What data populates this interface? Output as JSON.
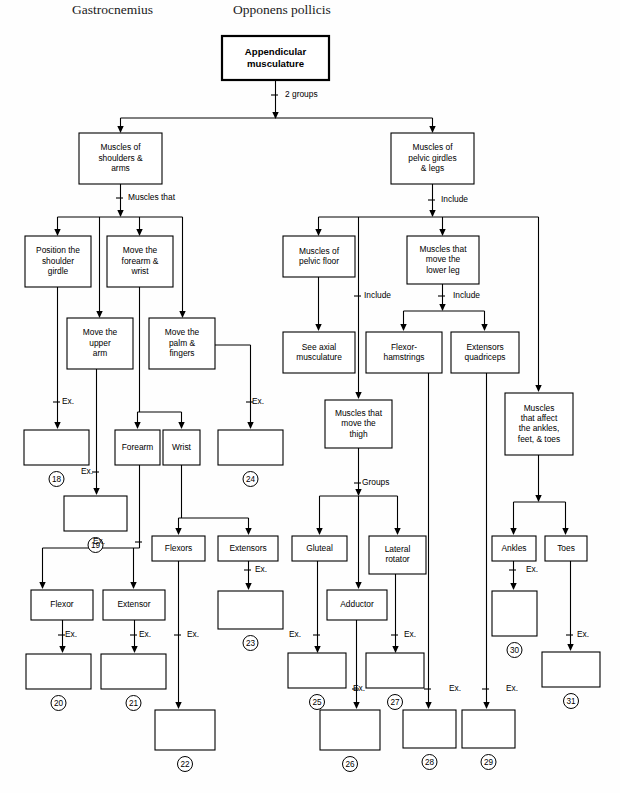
{
  "page": {
    "width": 620,
    "height": 793,
    "background": "#ffffff",
    "ink": "#000000"
  },
  "headers": [
    {
      "id": "h1",
      "text": "Gastrocnemius",
      "x": 72,
      "y": 10
    },
    {
      "id": "h2",
      "text": "Opponens pollicis",
      "x": 233,
      "y": 10
    }
  ],
  "chart_data": {
    "type": "diagram",
    "subtype": "hierarchical-flowchart",
    "root": "Appendicular musculature",
    "edge_labels": [
      "2 groups",
      "Muscles that",
      "Include",
      "Groups",
      "Ex."
    ],
    "answer_blanks": [
      18,
      19,
      20,
      21,
      22,
      23,
      24,
      25,
      26,
      27,
      28,
      29,
      30,
      31
    ]
  },
  "boxes": [
    {
      "id": "root",
      "label": "Appendicular\nmusculature",
      "x": 222,
      "y": 36,
      "w": 107,
      "h": 44,
      "bold": true
    },
    {
      "id": "shoulders",
      "label": "Muscles of\nshoulders &\narms",
      "x": 79,
      "y": 133,
      "w": 83,
      "h": 51
    },
    {
      "id": "pelvic",
      "label": "Muscles of\npelvic girdles\n& legs",
      "x": 391,
      "y": 133,
      "w": 83,
      "h": 51
    },
    {
      "id": "position",
      "label": "Position the\nshoulder\ngirdle",
      "x": 25,
      "y": 236,
      "w": 66,
      "h": 51
    },
    {
      "id": "forearmwrist",
      "label": "Move the\nforearm &\nwrist",
      "x": 107,
      "y": 236,
      "w": 66,
      "h": 51
    },
    {
      "id": "upperarm",
      "label": "Move the\nupper\narm",
      "x": 67,
      "y": 318,
      "w": 66,
      "h": 51
    },
    {
      "id": "palm",
      "label": "Move the\npalm &\nfingers",
      "x": 149,
      "y": 318,
      "w": 66,
      "h": 51
    },
    {
      "id": "pelvicfloor",
      "label": "Muscles of\npelvic floor",
      "x": 283,
      "y": 236,
      "w": 72,
      "h": 41
    },
    {
      "id": "lowerleg",
      "label": "Muscles that\nmove the\nlower leg",
      "x": 407,
      "y": 236,
      "w": 72,
      "h": 48
    },
    {
      "id": "seeaxial",
      "label": "See axial\nmusculature",
      "x": 283,
      "y": 332,
      "w": 72,
      "h": 41
    },
    {
      "id": "flexham",
      "label": "Flexor-\nhamstrings",
      "x": 366,
      "y": 332,
      "w": 76,
      "h": 41
    },
    {
      "id": "extquad",
      "label": "Extensors\nquadriceps",
      "x": 451,
      "y": 332,
      "w": 68,
      "h": 41
    },
    {
      "id": "anklesfeet",
      "label": "Muscles\nthat affect\nthe ankles,\nfeet, & toes",
      "x": 505,
      "y": 393,
      "w": 68,
      "h": 62
    },
    {
      "id": "thigh",
      "label": "Muscles that\nmove the\nthigh",
      "x": 325,
      "y": 400,
      "w": 67,
      "h": 48
    },
    {
      "id": "b18",
      "label": "",
      "x": 24,
      "y": 430,
      "w": 65,
      "h": 35,
      "num": 18
    },
    {
      "id": "forearm",
      "label": "Forearm",
      "x": 115,
      "y": 430,
      "w": 45,
      "h": 35
    },
    {
      "id": "wrist",
      "label": "Wrist",
      "x": 163,
      "y": 430,
      "w": 37,
      "h": 35
    },
    {
      "id": "b24",
      "label": "",
      "x": 218,
      "y": 430,
      "w": 65,
      "h": 35,
      "num": 24
    },
    {
      "id": "b19",
      "label": "",
      "x": 64,
      "y": 496,
      "w": 63,
      "h": 35,
      "num": 19
    },
    {
      "id": "flexors",
      "label": "Flexors",
      "x": 152,
      "y": 536,
      "w": 53,
      "h": 25
    },
    {
      "id": "extensors",
      "label": "Extensors",
      "x": 218,
      "y": 536,
      "w": 60,
      "h": 25
    },
    {
      "id": "gluteal",
      "label": "Gluteal",
      "x": 292,
      "y": 536,
      "w": 55,
      "h": 25
    },
    {
      "id": "lateralrot",
      "label": "Lateral\nrotator",
      "x": 369,
      "y": 536,
      "w": 57,
      "h": 38
    },
    {
      "id": "ankles",
      "label": "Ankles",
      "x": 492,
      "y": 536,
      "w": 44,
      "h": 25
    },
    {
      "id": "toes",
      "label": "Toes",
      "x": 545,
      "y": 536,
      "w": 42,
      "h": 25
    },
    {
      "id": "flexor",
      "label": "Flexor",
      "x": 31,
      "y": 590,
      "w": 62,
      "h": 30
    },
    {
      "id": "extensor",
      "label": "Extensor",
      "x": 103,
      "y": 590,
      "w": 62,
      "h": 30
    },
    {
      "id": "adductor",
      "label": "Adductor",
      "x": 327,
      "y": 590,
      "w": 60,
      "h": 30
    },
    {
      "id": "b23",
      "label": "",
      "x": 218,
      "y": 591,
      "w": 65,
      "h": 38,
      "num": 23
    },
    {
      "id": "b30",
      "label": "",
      "x": 492,
      "y": 591,
      "w": 45,
      "h": 45,
      "num": 30
    },
    {
      "id": "b20",
      "label": "",
      "x": 26,
      "y": 654,
      "w": 65,
      "h": 35,
      "num": 20
    },
    {
      "id": "b21",
      "label": "",
      "x": 101,
      "y": 654,
      "w": 65,
      "h": 35,
      "num": 21
    },
    {
      "id": "b25",
      "label": "",
      "x": 288,
      "y": 653,
      "w": 58,
      "h": 35,
      "num": 25
    },
    {
      "id": "b27",
      "label": "",
      "x": 366,
      "y": 653,
      "w": 58,
      "h": 35,
      "num": 27
    },
    {
      "id": "b31",
      "label": "",
      "x": 542,
      "y": 652,
      "w": 58,
      "h": 35,
      "num": 31
    },
    {
      "id": "b22",
      "label": "",
      "x": 155,
      "y": 710,
      "w": 60,
      "h": 40,
      "num": 22
    },
    {
      "id": "b26",
      "label": "",
      "x": 320,
      "y": 710,
      "w": 60,
      "h": 40,
      "num": 26
    },
    {
      "id": "b28",
      "label": "",
      "x": 403,
      "y": 710,
      "w": 53,
      "h": 38,
      "num": 28
    },
    {
      "id": "b29",
      "label": "",
      "x": 462,
      "y": 710,
      "w": 53,
      "h": 38,
      "num": 29
    }
  ],
  "edges": [
    {
      "id": "e-root-split",
      "label": "2 groups",
      "lx": 281,
      "ly": 95
    },
    {
      "id": "e-shoulders-split",
      "label": "Muscles that",
      "lx": 124,
      "ly": 198
    },
    {
      "id": "e-pelvic-split",
      "label": "Include",
      "lx": 437,
      "ly": 200
    },
    {
      "id": "e-pelvicfloor-axial",
      "label": "Include",
      "lx": 360,
      "ly": 296
    },
    {
      "id": "e-lowerleg-split",
      "label": "Include",
      "lx": 449,
      "ly": 296
    },
    {
      "id": "e-thigh-groups",
      "label": "Groups",
      "lx": 358,
      "ly": 483
    },
    {
      "id": "ex-18",
      "label": "Ex.",
      "lx": 58,
      "ly": 402
    },
    {
      "id": "ex-24",
      "label": "Ex.",
      "lx": 248,
      "ly": 402
    },
    {
      "id": "ex-19",
      "label": "Ex.",
      "lx": 97,
      "ly": 472
    },
    {
      "id": "ex-22",
      "label": "Ex.",
      "lx": 183,
      "ly": 635
    },
    {
      "id": "ex-flexor",
      "label": "Ex.",
      "lx": 61,
      "ly": 635
    },
    {
      "id": "ex-extensor",
      "label": "Ex.",
      "lx": 135,
      "ly": 635
    },
    {
      "id": "ex-23",
      "label": "Ex.",
      "lx": 251,
      "ly": 570
    },
    {
      "id": "ex-2021",
      "label": "Ex.",
      "lx": 109,
      "ly": 542
    },
    {
      "id": "ex-25",
      "label": "Ex.",
      "lx": 305,
      "ly": 635
    },
    {
      "id": "ex-27",
      "label": "Ex.",
      "lx": 400,
      "ly": 635
    },
    {
      "id": "ex-26",
      "label": "Ex.",
      "lx": 349,
      "ly": 689
    },
    {
      "id": "ex-28",
      "label": "Ex.",
      "lx": 445,
      "ly": 689
    },
    {
      "id": "ex-29",
      "label": "Ex.",
      "lx": 502,
      "ly": 689
    },
    {
      "id": "ex-30",
      "label": "Ex.",
      "lx": 522,
      "ly": 570
    },
    {
      "id": "ex-31",
      "label": "Ex.",
      "lx": 573,
      "ly": 635
    }
  ]
}
